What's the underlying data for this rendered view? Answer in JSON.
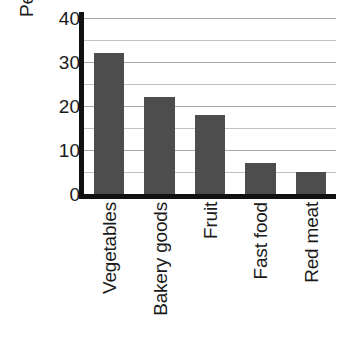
{
  "chart_data": {
    "type": "bar",
    "title": "",
    "xlabel": "",
    "ylabel": "Percent wasted",
    "categories": [
      "Vegetables",
      "Bakery goods",
      "Fruit",
      "Fast food",
      "Red meat"
    ],
    "values": [
      32,
      22,
      18,
      7,
      5
    ],
    "ylim": [
      0,
      40
    ],
    "yticks": [
      0,
      10,
      20,
      30,
      40
    ],
    "ytick_labels": [
      "0",
      "10",
      "20",
      "30",
      "40"
    ],
    "minor_gridlines": [
      5,
      15,
      25,
      35
    ],
    "major_gridlines": [
      10,
      20,
      30,
      40
    ],
    "grid": true,
    "legend": null,
    "legend_position": "none",
    "bar_color": "#4d4d4d",
    "axis_color": "#111111",
    "gridline_color": "#a8a8a8",
    "minor_gridline_color": "#c2c2c2",
    "background_color": "#ffffff",
    "xtick_rotation": 90
  }
}
